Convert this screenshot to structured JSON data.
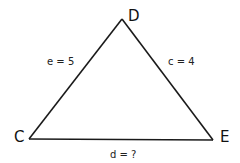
{
  "diagram": {
    "type": "triangle",
    "vertices": [
      {
        "id": "D",
        "label": "D"
      },
      {
        "id": "C",
        "label": "C"
      },
      {
        "id": "E",
        "label": "E"
      }
    ],
    "sides": [
      {
        "between": [
          "C",
          "D"
        ],
        "label": "e = 5"
      },
      {
        "between": [
          "D",
          "E"
        ],
        "label": "c = 4"
      },
      {
        "between": [
          "C",
          "E"
        ],
        "label": "d = ?"
      }
    ]
  }
}
